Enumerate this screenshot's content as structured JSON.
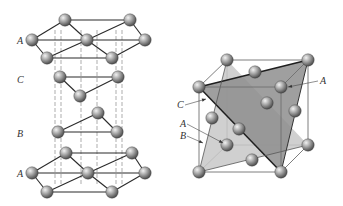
{
  "left_diagram": {
    "title": "stacking-sequence",
    "labels": [
      {
        "text": "A",
        "x": 17,
        "y": 44
      },
      {
        "text": "C",
        "x": 17,
        "y": 83
      },
      {
        "text": "B",
        "x": 17,
        "y": 137
      },
      {
        "text": "A",
        "x": 17,
        "y": 177
      }
    ],
    "layers": [
      {
        "name": "A-top",
        "atoms": [
          [
            65,
            20
          ],
          [
            130,
            20
          ],
          [
            32,
            40
          ],
          [
            87,
            40
          ],
          [
            145,
            40
          ],
          [
            47,
            58
          ],
          [
            112,
            58
          ]
        ],
        "bonds": [
          [
            0,
            1
          ],
          [
            0,
            2
          ],
          [
            0,
            3
          ],
          [
            1,
            3
          ],
          [
            1,
            4
          ],
          [
            2,
            3
          ],
          [
            3,
            4
          ],
          [
            2,
            5
          ],
          [
            3,
            5
          ],
          [
            3,
            6
          ],
          [
            4,
            6
          ],
          [
            5,
            6
          ]
        ]
      },
      {
        "name": "C",
        "atoms": [
          [
            60,
            77
          ],
          [
            118,
            77
          ],
          [
            80,
            96
          ]
        ],
        "bonds": [
          [
            0,
            1
          ],
          [
            0,
            2
          ],
          [
            1,
            2
          ]
        ]
      },
      {
        "name": "B",
        "atoms": [
          [
            98,
            113
          ],
          [
            58,
            132
          ],
          [
            117,
            132
          ]
        ],
        "bonds": [
          [
            0,
            1
          ],
          [
            0,
            2
          ],
          [
            1,
            2
          ]
        ]
      },
      {
        "name": "A-bottom",
        "atoms": [
          [
            66,
            153
          ],
          [
            132,
            153
          ],
          [
            32,
            173
          ],
          [
            88,
            173
          ],
          [
            145,
            173
          ],
          [
            47,
            192
          ],
          [
            112,
            192
          ]
        ],
        "bonds": [
          [
            0,
            1
          ],
          [
            0,
            2
          ],
          [
            0,
            3
          ],
          [
            1,
            3
          ],
          [
            1,
            4
          ],
          [
            2,
            3
          ],
          [
            3,
            4
          ],
          [
            2,
            5
          ],
          [
            3,
            5
          ],
          [
            3,
            6
          ],
          [
            4,
            6
          ],
          [
            5,
            6
          ]
        ]
      }
    ],
    "dashed_verticals": [
      55,
      61,
      81,
      97,
      116,
      122
    ]
  },
  "right_diagram": {
    "title": "fcc-close-packed-planes",
    "corners": {
      "btl": [
        227,
        60
      ],
      "btr": [
        308,
        60
      ],
      "ftl": [
        199,
        87
      ],
      "ftr": [
        281,
        87
      ],
      "bbl": [
        227,
        145
      ],
      "bbr": [
        308,
        145
      ],
      "fbl": [
        199,
        172
      ],
      "fbr": [
        281,
        172
      ]
    },
    "face_atoms": [
      [
        255,
        72
      ],
      [
        267,
        103
      ],
      [
        295,
        111
      ],
      [
        212,
        118
      ],
      [
        239,
        129
      ],
      [
        252,
        160
      ]
    ],
    "planes": [
      {
        "name": "plane-light",
        "points": [
          [
            227,
            60
          ],
          [
            199,
            172
          ],
          [
            308,
            145
          ]
        ],
        "color": "#c8c8c8"
      },
      {
        "name": "plane-dark",
        "points": [
          [
            199,
            87
          ],
          [
            308,
            60
          ],
          [
            281,
            172
          ]
        ],
        "color": "#8e8e8e"
      }
    ],
    "labels": [
      {
        "text": "A",
        "x": 320,
        "y": 84
      },
      {
        "text": "C",
        "x": 177,
        "y": 108
      },
      {
        "text": "A",
        "x": 180,
        "y": 127
      },
      {
        "text": "B",
        "x": 180,
        "y": 139
      }
    ],
    "arrows": [
      {
        "from": [
          318,
          81
        ],
        "to": [
          288,
          87
        ]
      },
      {
        "from": [
          185,
          105
        ],
        "to": [
          206,
          99
        ]
      },
      {
        "from": [
          187,
          124
        ],
        "to": [
          223,
          143
        ]
      },
      {
        "from": [
          187,
          136
        ],
        "to": [
          203,
          143
        ]
      }
    ]
  },
  "colors": {
    "atom_light": "#e6e6e6",
    "atom_mid": "#9a9a9a",
    "atom_dark": "#4e4e4e",
    "bond": "#2a2a2a",
    "dashed": "#8a8a8a",
    "cube_edge": "#6f6f6f"
  }
}
